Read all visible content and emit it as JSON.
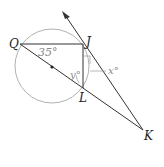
{
  "diagram": {
    "type": "geometry",
    "points": {
      "Q": {
        "label": "Q",
        "x": 20,
        "y": 44
      },
      "J": {
        "label": "J",
        "x": 83,
        "y": 44
      },
      "L": {
        "label": "L",
        "x": 83,
        "y": 88
      },
      "K": {
        "label": "K",
        "x": 143,
        "y": 130
      },
      "center": {
        "x": 52,
        "y": 67
      }
    },
    "circle": {
      "cx": 52,
      "cy": 66,
      "r": 37
    },
    "angles": {
      "angle_Q": {
        "label": "35°"
      },
      "angle_y": {
        "label": "y°"
      },
      "angle_x": {
        "label": "x°"
      }
    },
    "colors": {
      "line": "#333333",
      "circle": "#a8a8a8",
      "angle_label": "#888888",
      "point_label": "#222222"
    }
  }
}
